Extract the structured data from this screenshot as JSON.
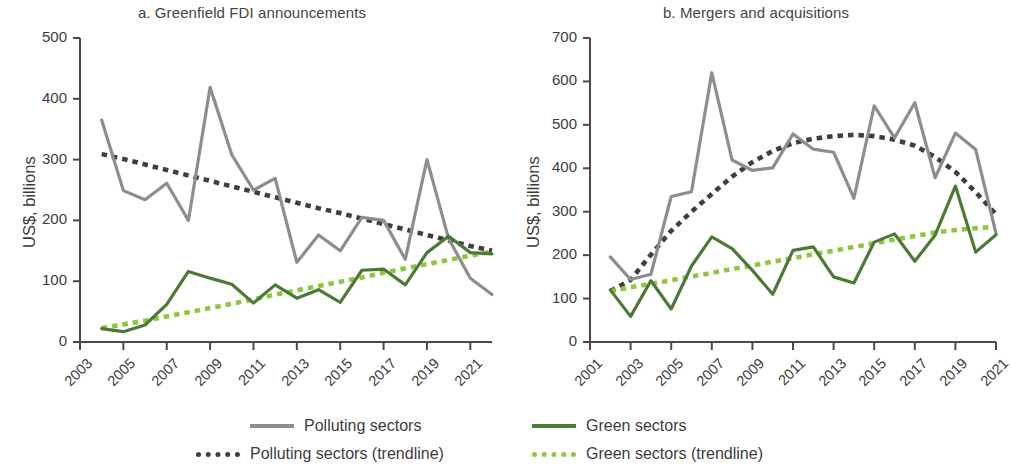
{
  "figure": {
    "width": 1008,
    "height": 471,
    "colors": {
      "polluting": "#8d8d8d",
      "polluting_trend": "#3f3f3f",
      "green": "#4c7a36",
      "green_trend": "#8dc63f",
      "axis": "#4a4a4a",
      "text": "#3c3c3c"
    }
  },
  "legend": {
    "position": "bottom",
    "items": [
      {
        "label": "Polluting sectors",
        "color": "#8d8d8d",
        "style": "solid"
      },
      {
        "label": "Green sectors",
        "color": "#4c7a36",
        "style": "solid"
      },
      {
        "label": "Polluting sectors (trendline)",
        "color": "#3f3f3f",
        "style": "dotted"
      },
      {
        "label": "Green sectors (trendline)",
        "color": "#8dc63f",
        "style": "dotted"
      }
    ]
  },
  "chart_data": [
    {
      "type": "line",
      "panel": "a",
      "title": "a. Greenfield FDI announcements",
      "xlabel": "",
      "ylabel": "US$, billions",
      "ylim": [
        0,
        500
      ],
      "ytick_step": 100,
      "yticks": [
        0,
        100,
        200,
        300,
        400,
        500
      ],
      "ytick_labels": [
        "0",
        "100",
        "200",
        "300",
        "400",
        "500"
      ],
      "xlim": [
        2003,
        2022
      ],
      "xticks": [
        2003,
        2005,
        2007,
        2009,
        2011,
        2013,
        2015,
        2017,
        2019,
        2021
      ],
      "xtick_labels": [
        "2003",
        "2005",
        "2007",
        "2009",
        "2011",
        "2013",
        "2015",
        "2017",
        "2019",
        "2021"
      ],
      "grid": false,
      "x": [
        2004,
        2005,
        2006,
        2007,
        2008,
        2009,
        2010,
        2011,
        2012,
        2013,
        2014,
        2015,
        2016,
        2017,
        2018,
        2019,
        2020,
        2021,
        2022
      ],
      "series": [
        {
          "name": "Polluting sectors",
          "color": "#8d8d8d",
          "style": "solid",
          "values": [
            365,
            249,
            234,
            261,
            200,
            419,
            308,
            250,
            269,
            131,
            176,
            150,
            205,
            200,
            136,
            300,
            170,
            105,
            78
          ]
        },
        {
          "name": "Green sectors",
          "color": "#4c7a36",
          "style": "solid",
          "values": [
            22,
            17,
            28,
            62,
            116,
            105,
            95,
            64,
            94,
            72,
            86,
            65,
            118,
            120,
            94,
            147,
            174,
            147,
            145
          ]
        },
        {
          "name": "Polluting sectors (trendline)",
          "color": "#3f3f3f",
          "style": "dotted",
          "values": [
            309,
            301,
            292,
            283,
            274,
            265,
            256,
            247,
            238,
            229,
            220,
            212,
            203,
            194,
            185,
            176,
            167,
            158,
            150
          ]
        },
        {
          "name": "Green sectors (trendline)",
          "color": "#8dc63f",
          "style": "dotted",
          "values": [
            23,
            29,
            35,
            42,
            49,
            56,
            63,
            70,
            78,
            85,
            92,
            99,
            106,
            114,
            121,
            128,
            135,
            142,
            149
          ]
        }
      ]
    },
    {
      "type": "line",
      "panel": "b",
      "title": "b. Mergers and acquisitions",
      "xlabel": "",
      "ylabel": "US$, billions",
      "ylim": [
        0,
        700
      ],
      "ytick_step": 100,
      "yticks": [
        0,
        100,
        200,
        300,
        400,
        500,
        600,
        700
      ],
      "ytick_labels": [
        "0",
        "100",
        "200",
        "300",
        "400",
        "500",
        "600",
        "700"
      ],
      "xlim": [
        2001,
        2021
      ],
      "xticks": [
        2001,
        2003,
        2005,
        2007,
        2009,
        2011,
        2013,
        2015,
        2017,
        2019,
        2021
      ],
      "xtick_labels": [
        "2001",
        "2003",
        "2005",
        "2007",
        "2009",
        "2011",
        "2013",
        "2015",
        "2017",
        "2019",
        "2021"
      ],
      "grid": false,
      "x": [
        2002,
        2003,
        2004,
        2005,
        2006,
        2007,
        2008,
        2009,
        2010,
        2011,
        2012,
        2013,
        2014,
        2015,
        2016,
        2017,
        2018,
        2019,
        2020,
        2021
      ],
      "series": [
        {
          "name": "Polluting sectors",
          "color": "#8d8d8d",
          "style": "solid",
          "values": [
            196,
            144,
            156,
            335,
            346,
            620,
            419,
            395,
            401,
            479,
            444,
            437,
            331,
            544,
            470,
            551,
            378,
            481,
            443,
            250
          ]
        },
        {
          "name": "Green sectors",
          "color": "#4c7a36",
          "style": "solid",
          "values": [
            120,
            59,
            141,
            76,
            175,
            242,
            215,
            165,
            110,
            211,
            219,
            150,
            136,
            230,
            249,
            186,
            246,
            359,
            207,
            247
          ]
        },
        {
          "name": "Polluting sectors (trendline)",
          "color": "#3f3f3f",
          "style": "dotted",
          "values": [
            117,
            143,
            201,
            256,
            300,
            341,
            381,
            414,
            440,
            458,
            468,
            474,
            477,
            474,
            466,
            452,
            426,
            392,
            345,
            294
          ]
        },
        {
          "name": "Green sectors (trendline)",
          "color": "#8dc63f",
          "style": "dotted",
          "values": [
            117,
            126,
            134,
            142,
            151,
            159,
            168,
            176,
            185,
            193,
            202,
            210,
            219,
            227,
            236,
            244,
            252,
            258,
            262,
            265
          ]
        }
      ]
    }
  ]
}
